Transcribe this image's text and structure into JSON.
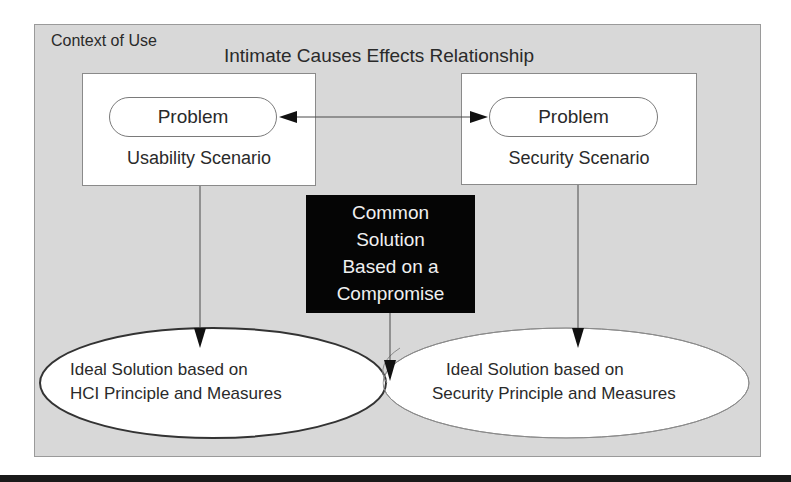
{
  "diagram": {
    "context_label": "Context of Use",
    "relationship_title": "Intimate Causes Effects Relationship",
    "left_scenario": {
      "problem_label": "Problem",
      "scenario_label": "Usability Scenario"
    },
    "right_scenario": {
      "problem_label": "Problem",
      "scenario_label": "Security Scenario"
    },
    "compromise": {
      "lines": [
        "Common",
        "Solution",
        "Based on a",
        "Compromise"
      ]
    },
    "left_solution": {
      "lines": [
        "Ideal Solution based on",
        "HCI Principle and Measures"
      ]
    },
    "right_solution": {
      "lines": [
        "Ideal Solution based on",
        "Security Principle and Measures"
      ]
    },
    "colors": {
      "context_bg": "#d8d8d8",
      "box_bg": "#ffffff",
      "compromise_bg": "#050505",
      "compromise_text": "#f0f0f0",
      "line": "#3a3a3a"
    }
  }
}
